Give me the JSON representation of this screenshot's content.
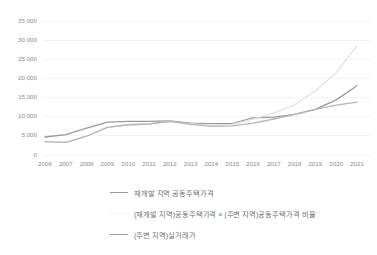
{
  "chart_data": {
    "type": "line",
    "title": "",
    "xlabel": "",
    "ylabel": "",
    "ylim": [
      0,
      35000
    ],
    "grid": true,
    "legend_position": "bottom",
    "categories": [
      "2006",
      "2007",
      "2008",
      "2009",
      "2010",
      "2011",
      "2012",
      "2013",
      "2014",
      "2015",
      "2016",
      "2017",
      "2018",
      "2019",
      "2020",
      "2021"
    ],
    "ytick_labels": [
      "35,000",
      "30,000",
      "25,000",
      "20,000",
      "15,000",
      "10,000",
      "5,000",
      "0"
    ],
    "ytick_values": [
      35000,
      30000,
      25000,
      20000,
      15000,
      10000,
      5000,
      0
    ],
    "series": [
      {
        "name": "재개발 지역 공동주택가격",
        "color": "#9a9a9a",
        "width": 1.3,
        "values": [
          4700,
          5300,
          7000,
          8600,
          8800,
          8800,
          8900,
          8300,
          8200,
          8200,
          9700,
          9900,
          10600,
          11900,
          14400,
          18100
        ]
      },
      {
        "name": "(재개발 지역)공동주택가격 × (주변 지역)공동주택가격 비율",
        "color": "#e2e2e2",
        "width": 1.3,
        "values": [
          3500,
          3300,
          4900,
          7200,
          7900,
          8100,
          8800,
          8100,
          7800,
          8000,
          9400,
          11000,
          13100,
          16800,
          21500,
          28500
        ]
      },
      {
        "name": "(주변 지역)실거래가",
        "color": "#b5b5b5",
        "width": 1.3,
        "values": [
          3500,
          3300,
          4900,
          7200,
          7900,
          8100,
          8800,
          8000,
          7500,
          7600,
          8300,
          9400,
          10600,
          11900,
          13000,
          13800
        ]
      }
    ],
    "legend": [
      {
        "label": "재개발 지역 공동주택가격",
        "color": "#9a9a9a"
      },
      {
        "label": "(재개발 지역)공동주택가격 × (주변 지역)공동주택가격 비율",
        "color": "#f2f2f2"
      },
      {
        "label": "(주변 지역)실거래가",
        "color": "#9a9a9a"
      }
    ]
  }
}
